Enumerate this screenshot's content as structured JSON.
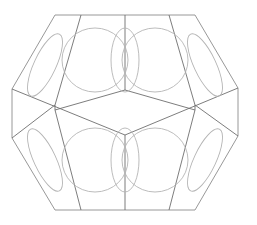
{
  "figure": {
    "stroke_color": "#8c8c8c",
    "circle_color": "#b4b4b4",
    "background": "#ffffff"
  },
  "outline": [
    [
      55,
      15
    ],
    [
      195,
      15
    ],
    [
      238,
      88
    ],
    [
      238,
      136
    ],
    [
      195,
      210
    ],
    [
      55,
      210
    ],
    [
      12,
      138
    ],
    [
      12,
      89
    ]
  ],
  "inner_lines": [
    [
      [
        81,
        15
      ],
      [
        55,
        105
      ]
    ],
    [
      [
        169,
        15
      ],
      [
        195,
        105
      ]
    ],
    [
      [
        125,
        15
      ],
      [
        125,
        90
      ]
    ],
    [
      [
        125,
        90
      ],
      [
        55,
        110
      ]
    ],
    [
      [
        125,
        90
      ],
      [
        195,
        110
      ]
    ],
    [
      [
        12,
        89
      ],
      [
        125,
        135
      ]
    ],
    [
      [
        238,
        88
      ],
      [
        125,
        135
      ]
    ],
    [
      [
        55,
        105
      ],
      [
        12,
        138
      ]
    ],
    [
      [
        195,
        105
      ],
      [
        238,
        136
      ]
    ],
    [
      [
        125,
        135
      ],
      [
        125,
        210
      ]
    ],
    [
      [
        55,
        110
      ],
      [
        81,
        210
      ]
    ],
    [
      [
        195,
        110
      ],
      [
        169,
        210
      ]
    ],
    [
      [
        55,
        105
      ],
      [
        55,
        110
      ]
    ],
    [
      [
        195,
        105
      ],
      [
        195,
        110
      ]
    ]
  ],
  "circles": [
    {
      "cx": 95,
      "cy": 60,
      "rx": 33,
      "ry": 32
    },
    {
      "cx": 155,
      "cy": 60,
      "rx": 33,
      "ry": 32
    },
    {
      "cx": 95,
      "cy": 160,
      "rx": 33,
      "ry": 32
    },
    {
      "cx": 155,
      "cy": 160,
      "rx": 33,
      "ry": 32
    },
    {
      "cx": 45,
      "cy": 65,
      "rx": 11,
      "ry": 34,
      "rot": 25
    },
    {
      "cx": 205,
      "cy": 65,
      "rx": 11,
      "ry": 34,
      "rot": -25
    },
    {
      "cx": 45,
      "cy": 160,
      "rx": 11,
      "ry": 34,
      "rot": -25
    },
    {
      "cx": 205,
      "cy": 160,
      "rx": 11,
      "ry": 34,
      "rot": 25
    },
    {
      "cx": 125,
      "cy": 60,
      "rx": 14,
      "ry": 32
    },
    {
      "cx": 125,
      "cy": 160,
      "rx": 14,
      "ry": 32
    }
  ]
}
